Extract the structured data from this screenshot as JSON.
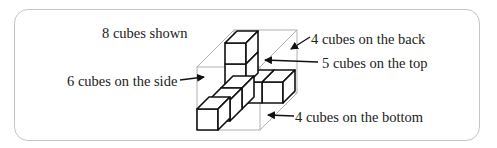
{
  "diagram": {
    "title_label": "8 cubes  shown",
    "labels": {
      "side": "6 cubes on the side",
      "back": "4 cubes on the back",
      "top": "5 cubes on the top",
      "bottom": "4 cubes on the bottom"
    },
    "colors": {
      "cube_stroke": "#111111",
      "box_stroke": "#b0b0b0",
      "frame_stroke": "#c4c4c4",
      "text": "#222222"
    }
  }
}
